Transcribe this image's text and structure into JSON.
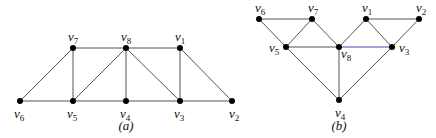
{
  "figures": [
    {
      "id": "a",
      "caption": "(a)",
      "caption_pos": [
        126,
        130
      ],
      "nodes": [
        {
          "id": "v6",
          "name": "v",
          "sub": "6",
          "x": 20,
          "y": 101,
          "lx": 14,
          "ly": 118
        },
        {
          "id": "v5",
          "name": "v",
          "sub": "5",
          "x": 73,
          "y": 101,
          "lx": 67,
          "ly": 118
        },
        {
          "id": "v4",
          "name": "v",
          "sub": "4",
          "x": 126,
          "y": 101,
          "lx": 120,
          "ly": 118
        },
        {
          "id": "v3",
          "name": "v",
          "sub": "3",
          "x": 180,
          "y": 101,
          "lx": 174,
          "ly": 118
        },
        {
          "id": "v2",
          "name": "v",
          "sub": "2",
          "x": 232,
          "y": 101,
          "lx": 229,
          "ly": 118
        },
        {
          "id": "v7",
          "name": "v",
          "sub": "7",
          "x": 73,
          "y": 48,
          "lx": 68,
          "ly": 41
        },
        {
          "id": "v8",
          "name": "v",
          "sub": "8",
          "x": 126,
          "y": 48,
          "lx": 121,
          "ly": 41
        },
        {
          "id": "v1",
          "name": "v",
          "sub": "1",
          "x": 180,
          "y": 48,
          "lx": 175,
          "ly": 41
        }
      ],
      "edges": [
        [
          "v6",
          "v5"
        ],
        [
          "v5",
          "v4"
        ],
        [
          "v4",
          "v3"
        ],
        [
          "v3",
          "v2"
        ],
        [
          "v7",
          "v8"
        ],
        [
          "v8",
          "v1"
        ],
        [
          "v6",
          "v7"
        ],
        [
          "v7",
          "v5"
        ],
        [
          "v5",
          "v8"
        ],
        [
          "v8",
          "v4"
        ],
        [
          "v8",
          "v3"
        ],
        [
          "v1",
          "v3"
        ],
        [
          "v1",
          "v2"
        ]
      ]
    },
    {
      "id": "b",
      "caption": "(b)",
      "caption_pos": [
        339,
        130
      ],
      "nodes": [
        {
          "id": "v6",
          "name": "v",
          "sub": "6",
          "x": 259,
          "y": 19,
          "lx": 255,
          "ly": 12
        },
        {
          "id": "v7",
          "name": "v",
          "sub": "7",
          "x": 312,
          "y": 19,
          "lx": 308,
          "ly": 12
        },
        {
          "id": "v1",
          "name": "v",
          "sub": "1",
          "x": 366,
          "y": 19,
          "lx": 362,
          "ly": 12
        },
        {
          "id": "v2",
          "name": "v",
          "sub": "2",
          "x": 419,
          "y": 19,
          "lx": 416,
          "ly": 12
        },
        {
          "id": "v5",
          "name": "v",
          "sub": "5",
          "x": 286,
          "y": 47,
          "lx": 269,
          "ly": 52
        },
        {
          "id": "v8",
          "name": "v",
          "sub": "8",
          "x": 339,
          "y": 47,
          "lx": 341,
          "ly": 58
        },
        {
          "id": "v3",
          "name": "v",
          "sub": "3",
          "x": 392,
          "y": 47,
          "lx": 399,
          "ly": 52
        },
        {
          "id": "v4",
          "name": "v",
          "sub": "4",
          "x": 339,
          "y": 100,
          "lx": 335,
          "ly": 117
        }
      ],
      "edges": [
        [
          "v6",
          "v7"
        ],
        [
          "v1",
          "v2"
        ],
        [
          "v6",
          "v5"
        ],
        [
          "v7",
          "v5"
        ],
        [
          "v7",
          "v8"
        ],
        [
          "v1",
          "v8"
        ],
        [
          "v1",
          "v3"
        ],
        [
          "v2",
          "v3"
        ],
        [
          "v5",
          "v8"
        ],
        [
          "v8",
          "v3"
        ],
        [
          "v5",
          "v4"
        ],
        [
          "v8",
          "v4"
        ],
        [
          "v3",
          "v4"
        ]
      ],
      "highlight_edges": [
        [
          "v8",
          "v3"
        ]
      ]
    }
  ],
  "colors": {
    "edge": "#555555",
    "highlight_edge": "#4a4aa8",
    "node": "#000000"
  }
}
